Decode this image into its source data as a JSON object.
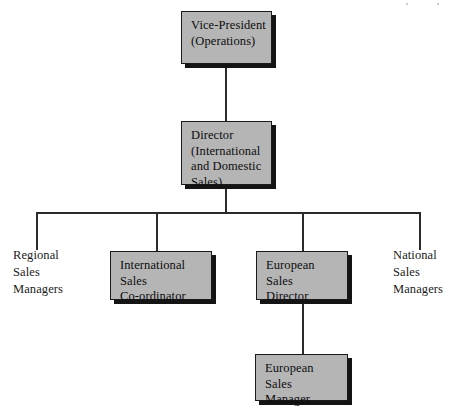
{
  "chart": {
    "type": "organizational-chart",
    "nodes": [
      {
        "id": "vice-president",
        "label": "Vice-President\n(Operations)",
        "style": "boxed",
        "level": 0
      },
      {
        "id": "director",
        "label": "Director\n(International\nand Domestic\nSales)",
        "style": "boxed",
        "level": 1
      },
      {
        "id": "regional-sales-managers",
        "label": "Regional\nSales\nManagers",
        "style": "plain",
        "level": 2
      },
      {
        "id": "international-sales-coordinator",
        "label": "International\nSales\nCo-ordinator",
        "style": "boxed",
        "level": 2
      },
      {
        "id": "european-sales-director",
        "label": "European\nSales\nDirector",
        "style": "boxed",
        "level": 2
      },
      {
        "id": "national-sales-managers",
        "label": "National\nSales\nManagers",
        "style": "plain",
        "level": 2
      },
      {
        "id": "european-sales-manager",
        "label": "European\nSales\nManager",
        "style": "boxed",
        "level": 3
      }
    ],
    "edges": [
      {
        "from": "vice-president",
        "to": "director"
      },
      {
        "from": "director",
        "to": "regional-sales-managers"
      },
      {
        "from": "director",
        "to": "international-sales-coordinator"
      },
      {
        "from": "director",
        "to": "european-sales-director"
      },
      {
        "from": "director",
        "to": "national-sales-managers"
      },
      {
        "from": "european-sales-director",
        "to": "european-sales-manager"
      }
    ],
    "colors": {
      "box_fill": "#b5b5b5",
      "box_border": "#1a1a1a",
      "box_shadow": "#141414",
      "line": "#2b2b2b",
      "text": "#0d0d0d",
      "background": "#ffffff"
    }
  }
}
